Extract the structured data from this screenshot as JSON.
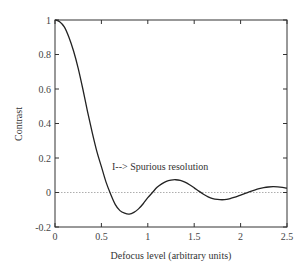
{
  "chart_data": {
    "type": "line",
    "title": "",
    "xlabel": "Defocus level  (arbitrary units)",
    "ylabel": "Contrast",
    "xlim": [
      0,
      2.5
    ],
    "ylim": [
      -0.2,
      1
    ],
    "xticks": [
      "0",
      "0.5",
      "1",
      "1.5",
      "2",
      "2.5"
    ],
    "yticks": [
      "-0.2",
      "0",
      "0.2",
      "0.4",
      "0.6",
      "0.8",
      "1"
    ],
    "grid": false,
    "legend": null,
    "reference_line": {
      "y": 0,
      "style": "dotted"
    },
    "annotation": {
      "text": "I--> Spurious resolution",
      "x": 0.62,
      "y": 0.2
    },
    "series": [
      {
        "name": "Contrast",
        "x": [
          0,
          0.05,
          0.1,
          0.15,
          0.2,
          0.25,
          0.3,
          0.35,
          0.4,
          0.45,
          0.5,
          0.55,
          0.6,
          0.65,
          0.7,
          0.75,
          0.8,
          0.85,
          0.9,
          0.95,
          1.0,
          1.05,
          1.1,
          1.15,
          1.2,
          1.25,
          1.3,
          1.35,
          1.4,
          1.45,
          1.5,
          1.55,
          1.6,
          1.65,
          1.7,
          1.75,
          1.8,
          1.85,
          1.9,
          1.95,
          2.0,
          2.05,
          2.1,
          2.15,
          2.2,
          2.25,
          2.3,
          2.35,
          2.4,
          2.45,
          2.5
        ],
        "values": [
          1.0,
          0.99,
          0.96,
          0.9,
          0.82,
          0.72,
          0.6,
          0.47,
          0.35,
          0.24,
          0.15,
          0.06,
          -0.01,
          -0.07,
          -0.105,
          -0.12,
          -0.125,
          -0.115,
          -0.095,
          -0.065,
          -0.03,
          0.0,
          0.03,
          0.05,
          0.065,
          0.072,
          0.074,
          0.07,
          0.06,
          0.045,
          0.027,
          0.008,
          -0.01,
          -0.025,
          -0.035,
          -0.04,
          -0.042,
          -0.04,
          -0.033,
          -0.025,
          -0.015,
          -0.005,
          0.005,
          0.014,
          0.022,
          0.028,
          0.032,
          0.034,
          0.033,
          0.03,
          0.025
        ]
      }
    ]
  }
}
